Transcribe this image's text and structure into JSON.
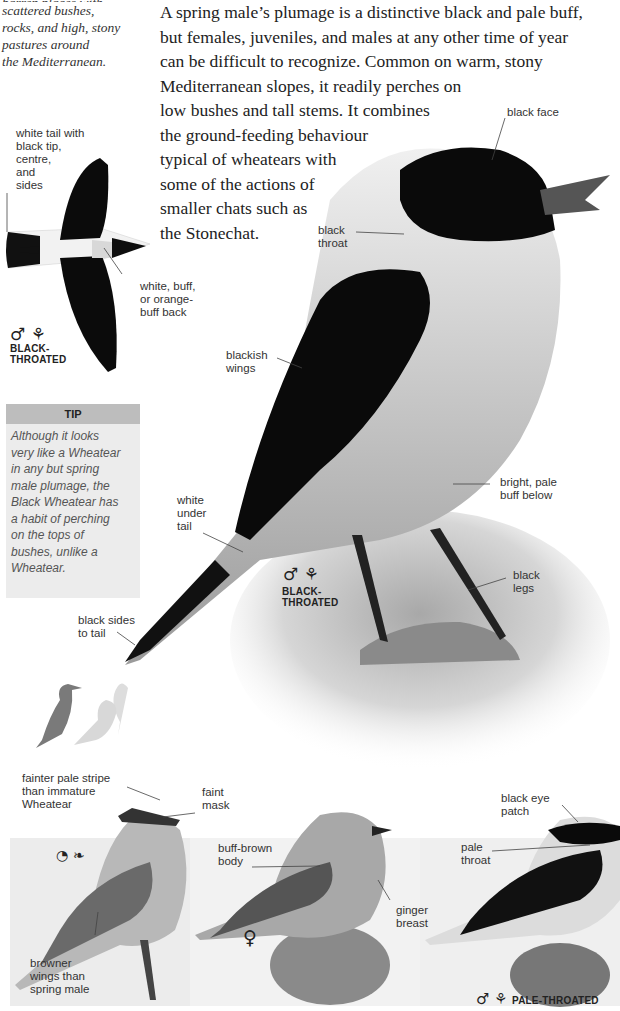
{
  "habitat": {
    "lines": [
      "barren places with",
      "scattered bushes,",
      "rocks, and high, stony",
      "pastures around",
      "the Mediterranean."
    ]
  },
  "description": {
    "lines": [
      "A spring male’s plumage is a distinctive black and pale buff,",
      "but females, juveniles, and males at any other time of year",
      "can be difficult to recognize. Common on warm, stony",
      "Mediterranean slopes, it readily perches on",
      "low bushes and tall stems. It combines",
      "the ground-feeding behaviour",
      "typical of wheatears with",
      "some of the actions of",
      "smaller chats such as",
      "the Stonechat."
    ]
  },
  "flight_figure": {
    "labels": {
      "tail": [
        "white tail with",
        "black tip,",
        "centre,",
        "and",
        "sides"
      ],
      "back": [
        "white, buff,",
        "or orange-",
        "buff back"
      ]
    },
    "symbols": "♂ ⚘",
    "variant": [
      "BLACK-",
      "THROATED"
    ]
  },
  "tip": {
    "heading": "TIP",
    "lines": [
      "Although it looks",
      "very like a Wheatear",
      "in any but spring",
      "male plumage, the",
      "Black Wheatear has",
      "a habit of perching",
      "on the tops of",
      "bushes, unlike a",
      "Wheatear."
    ]
  },
  "main_figure": {
    "labels": {
      "black_face": "black face",
      "black_throat": [
        "black",
        "throat"
      ],
      "blackish_wings": [
        "blackish",
        "wings"
      ],
      "pale_buff": [
        "bright, pale",
        "buff below"
      ],
      "white_under_tail": [
        "white",
        "under",
        "tail"
      ],
      "black_legs": [
        "black",
        "legs"
      ],
      "black_sides": [
        "black sides",
        "to tail"
      ]
    },
    "symbols": "♂ ⚘",
    "variant": [
      "BLACK-",
      "THROATED"
    ]
  },
  "size_comparison": {
    "icon": "size-silhouette-icon"
  },
  "bottom_figures": {
    "immature": {
      "labels": {
        "stripe": [
          "fainter pale stripe",
          "than immature",
          "Wheatear"
        ],
        "mask": [
          "faint",
          "mask"
        ],
        "wings": [
          "browner",
          "wings than",
          "spring male"
        ]
      },
      "symbols": "◔ ❧"
    },
    "female": {
      "labels": {
        "body": [
          "buff-brown",
          "body"
        ],
        "breast": [
          "ginger",
          "breast"
        ]
      },
      "symbols": "♀"
    },
    "pale_male": {
      "labels": {
        "eye": [
          "black eye",
          "patch"
        ],
        "throat": [
          "pale",
          "throat"
        ]
      },
      "symbols": "♂ ⚘",
      "variant": "PALE-THROATED"
    }
  }
}
